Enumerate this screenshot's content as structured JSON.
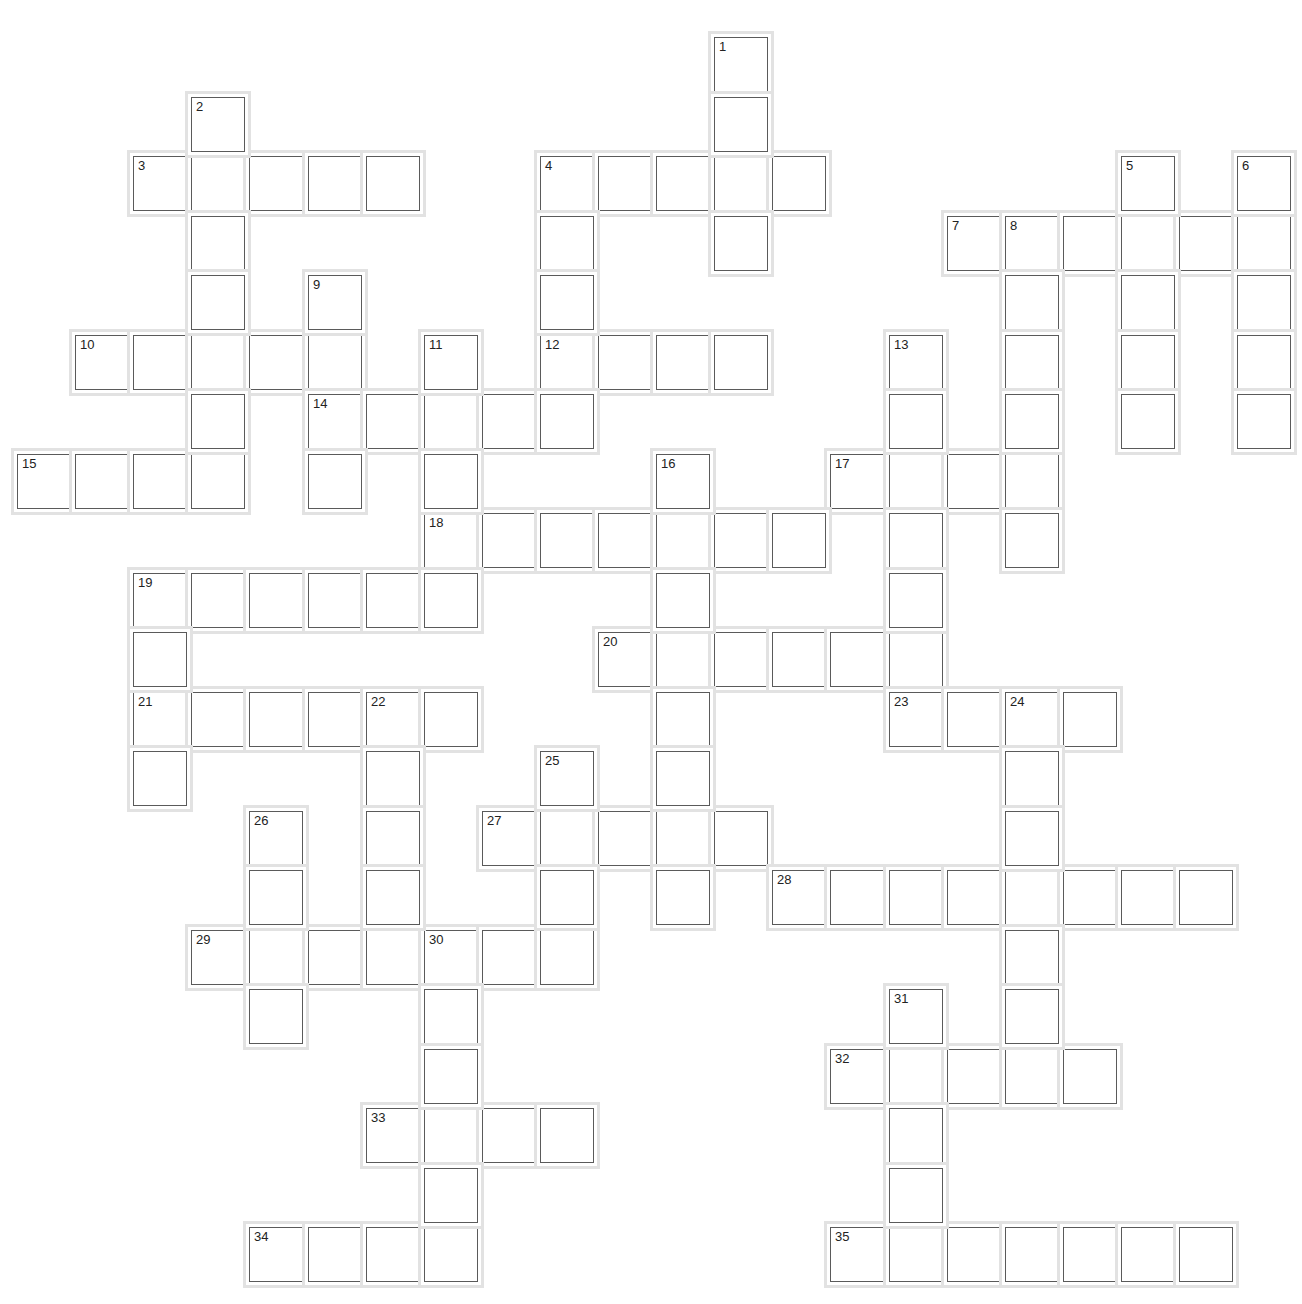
{
  "puzzle": {
    "type": "crossword",
    "grid": {
      "origin_x": 17,
      "origin_y": 37,
      "pitch_x": 58.1,
      "pitch_y": 59.5
    },
    "across": [
      {
        "num": 3,
        "row": 2,
        "col": 2,
        "len": 5
      },
      {
        "num": 4,
        "row": 2,
        "col": 9,
        "len": 5
      },
      {
        "num": 7,
        "row": 3,
        "col": 16,
        "len": 6
      },
      {
        "num": 10,
        "row": 5,
        "col": 1,
        "len": 5
      },
      {
        "num": 12,
        "row": 5,
        "col": 9,
        "len": 4
      },
      {
        "num": 14,
        "row": 6,
        "col": 5,
        "len": 5
      },
      {
        "num": 15,
        "row": 7,
        "col": 0,
        "len": 4
      },
      {
        "num": 17,
        "row": 7,
        "col": 14,
        "len": 4
      },
      {
        "num": 18,
        "row": 8,
        "col": 7,
        "len": 7
      },
      {
        "num": 19,
        "row": 9,
        "col": 2,
        "len": 6
      },
      {
        "num": 20,
        "row": 10,
        "col": 10,
        "len": 6
      },
      {
        "num": 21,
        "row": 11,
        "col": 2,
        "len": 6
      },
      {
        "num": 23,
        "row": 11,
        "col": 15,
        "len": 4
      },
      {
        "num": 27,
        "row": 13,
        "col": 8,
        "len": 5
      },
      {
        "num": 28,
        "row": 14,
        "col": 13,
        "len": 8
      },
      {
        "num": 29,
        "row": 15,
        "col": 3,
        "len": 7
      },
      {
        "num": 32,
        "row": 17,
        "col": 14,
        "len": 5
      },
      {
        "num": 33,
        "row": 18,
        "col": 6,
        "len": 4
      },
      {
        "num": 34,
        "row": 20,
        "col": 4,
        "len": 4
      },
      {
        "num": 35,
        "row": 20,
        "col": 14,
        "len": 7
      }
    ],
    "down": [
      {
        "num": 1,
        "row": 0,
        "col": 12,
        "len": 4
      },
      {
        "num": 2,
        "row": 1,
        "col": 3,
        "len": 6
      },
      {
        "num": 4,
        "row": 2,
        "col": 9,
        "len": 4
      },
      {
        "num": 5,
        "row": 2,
        "col": 19,
        "len": 5
      },
      {
        "num": 6,
        "row": 2,
        "col": 21,
        "len": 5
      },
      {
        "num": 8,
        "row": 3,
        "col": 17,
        "len": 6
      },
      {
        "num": 9,
        "row": 4,
        "col": 5,
        "len": 4
      },
      {
        "num": 11,
        "row": 5,
        "col": 7,
        "len": 5
      },
      {
        "num": 13,
        "row": 5,
        "col": 15,
        "len": 6
      },
      {
        "num": 16,
        "row": 7,
        "col": 11,
        "len": 8
      },
      {
        "num": 19,
        "row": 9,
        "col": 2,
        "len": 4
      },
      {
        "num": 22,
        "row": 11,
        "col": 6,
        "len": 5
      },
      {
        "num": 24,
        "row": 11,
        "col": 17,
        "len": 7
      },
      {
        "num": 25,
        "row": 12,
        "col": 9,
        "len": 4
      },
      {
        "num": 26,
        "row": 13,
        "col": 4,
        "len": 4
      },
      {
        "num": 30,
        "row": 15,
        "col": 7,
        "len": 6
      },
      {
        "num": 31,
        "row": 16,
        "col": 15,
        "len": 5
      }
    ]
  },
  "colors": {
    "cell_border": "#5a5a5a",
    "halo": "#e2e2e2",
    "background": "#ffffff"
  }
}
